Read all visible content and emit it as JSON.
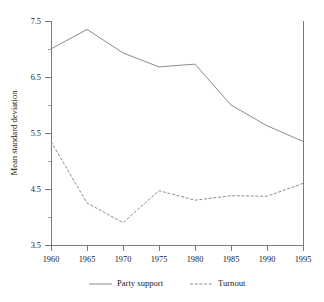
{
  "chart_data": {
    "type": "line",
    "title": "",
    "xlabel": "",
    "ylabel": "Mean standard deviation",
    "x": [
      1960,
      1965,
      1970,
      1975,
      1980,
      1985,
      1990,
      1995
    ],
    "xtick_labels": [
      "1960",
      "1965",
      "1970",
      "1975",
      "1980",
      "1985",
      "1990",
      "1995"
    ],
    "ytick_labels": [
      "7.5",
      "6.5",
      "5.5",
      "4.5",
      "3.5"
    ],
    "ytick_values": [
      7.5,
      6.5,
      5.5,
      4.5,
      3.5
    ],
    "yminor_values": [
      7.0,
      6.0,
      5.0,
      4.0
    ],
    "xlim": [
      1960,
      1995
    ],
    "ylim": [
      3.5,
      7.5
    ],
    "grid": false,
    "legend_position": "bottom",
    "series": [
      {
        "name": "Party support",
        "style": "solid",
        "color": "#8c8c8c",
        "values": [
          7.0,
          7.35,
          6.93,
          6.68,
          6.73,
          6.0,
          5.63,
          5.35
        ]
      },
      {
        "name": "Turnout",
        "style": "dashed",
        "color": "#8c8c8c",
        "values": [
          5.35,
          4.25,
          3.9,
          4.47,
          4.3,
          4.38,
          4.37,
          4.6
        ]
      }
    ]
  },
  "legend": {
    "items": [
      {
        "label": "Party support",
        "style": "solid"
      },
      {
        "label": "Turnout",
        "style": "dashed"
      }
    ]
  },
  "axes": {
    "y_title": "Mean standard deviation"
  }
}
